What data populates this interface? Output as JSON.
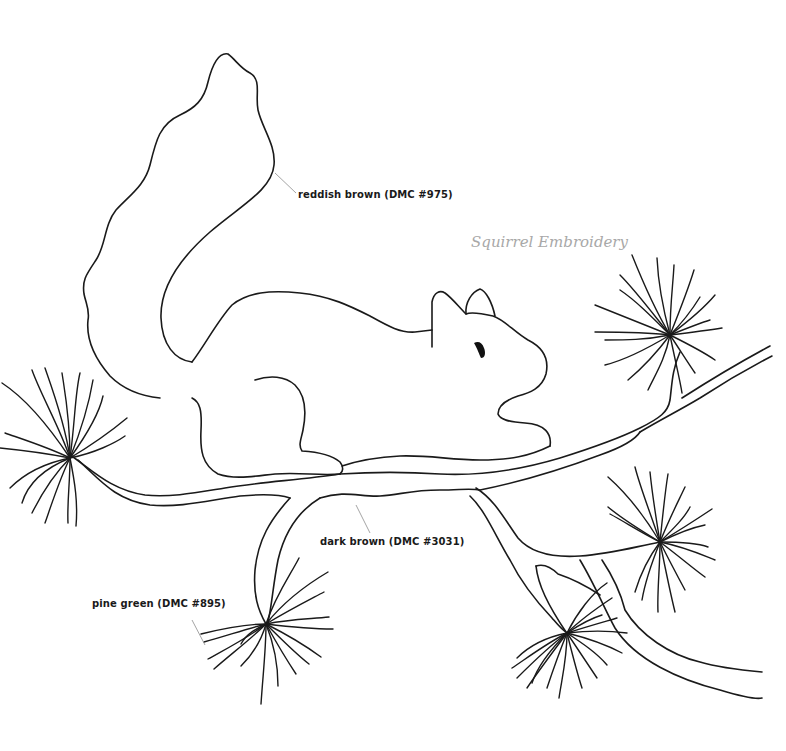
{
  "title": "Squirrel Embroidery",
  "colors": {
    "line": "#1a1a1a",
    "leader": "#9a9a9a",
    "title": "#a8a8a8",
    "background": "#ffffff"
  },
  "labels": [
    {
      "id": "tail",
      "text": "reddish brown (DMC #975)",
      "region": "squirrel-body-and-tail"
    },
    {
      "id": "branch",
      "text": "dark brown (DMC #3031)",
      "region": "branch"
    },
    {
      "id": "needles",
      "text": "pine green (DMC #895)",
      "region": "pine-needle-clusters"
    }
  ],
  "elements": {
    "squirrel": {
      "parts": [
        "tail",
        "body",
        "head",
        "ears",
        "eye",
        "front-paw",
        "hind-leg"
      ]
    },
    "branch": {
      "parts": [
        "main-branch",
        "lower-left-twig",
        "right-upper-twig",
        "lower-right-fork"
      ]
    },
    "pine_clusters": {
      "count": 5,
      "positions": [
        "left",
        "upper-right",
        "middle-right",
        "lower-center",
        "lower-left"
      ]
    }
  }
}
